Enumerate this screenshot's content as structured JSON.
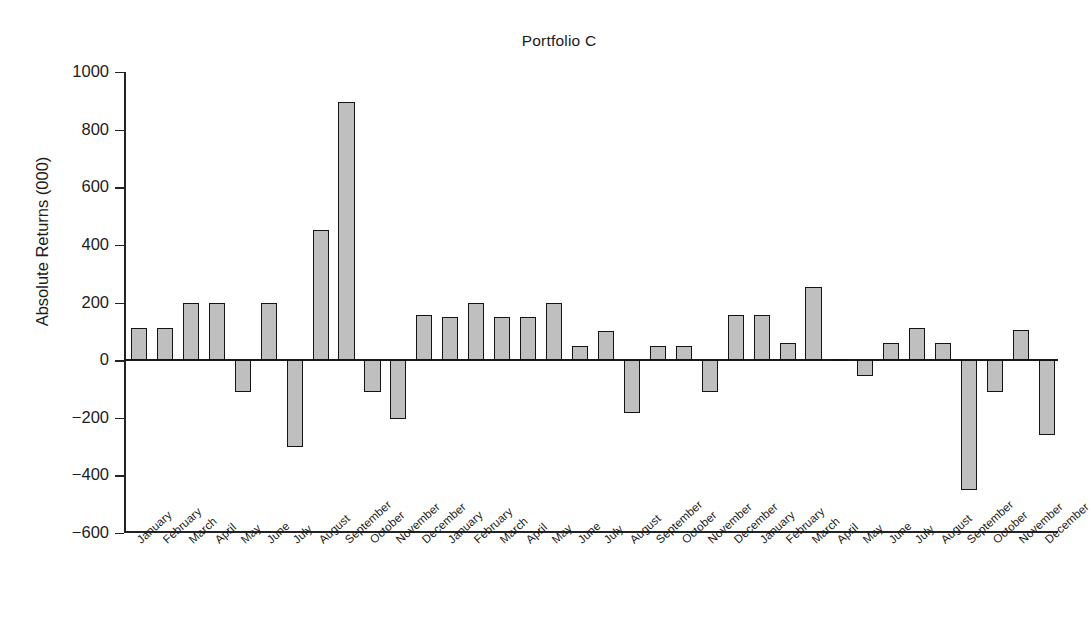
{
  "chart_data": {
    "type": "bar",
    "title": "Portfolio C",
    "xlabel": "",
    "ylabel": "Absolute Returns (000)",
    "ylim": [
      -600,
      1000
    ],
    "ytick_labels": [
      "1000",
      "800",
      "600",
      "400",
      "200",
      "0",
      "−200",
      "−400",
      "−600"
    ],
    "yticks": [
      1000,
      800,
      600,
      400,
      200,
      0,
      -200,
      -400,
      -600
    ],
    "grid": false,
    "legend": null,
    "bar_color": "#bfbfbf",
    "bar_edge_color": "#141414",
    "categories": [
      "January",
      "February",
      "March",
      "April",
      "May",
      "June",
      "July",
      "August",
      "September",
      "October",
      "November",
      "December",
      "January",
      "February",
      "March",
      "April",
      "May",
      "June",
      "July",
      "August",
      "September",
      "October",
      "November",
      "December",
      "January",
      "February",
      "March",
      "April",
      "May",
      "June",
      "July",
      "August",
      "September",
      "October",
      "November",
      "December"
    ],
    "values": [
      110,
      110,
      200,
      200,
      -110,
      200,
      -300,
      450,
      895,
      -110,
      -205,
      155,
      150,
      200,
      150,
      150,
      200,
      50,
      100,
      -185,
      50,
      50,
      -110,
      155,
      155,
      60,
      255,
      5,
      -55,
      60,
      110,
      60,
      -450,
      -110,
      105,
      -260
    ]
  }
}
